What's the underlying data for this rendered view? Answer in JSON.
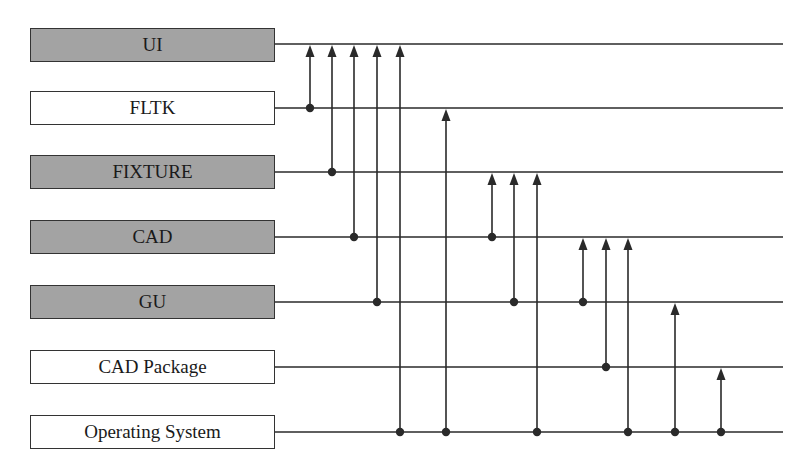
{
  "diagram": {
    "type": "layered dependency diagram",
    "layers": [
      {
        "id": "ui",
        "label": "UI",
        "style": "gray",
        "y": 44
      },
      {
        "id": "fltk",
        "label": "FLTK",
        "style": "white",
        "y": 108
      },
      {
        "id": "fixture",
        "label": "FIXTURE",
        "style": "gray",
        "y": 172
      },
      {
        "id": "cad",
        "label": "CAD",
        "style": "gray",
        "y": 237
      },
      {
        "id": "gu",
        "label": "GU",
        "style": "gray",
        "y": 302
      },
      {
        "id": "cad_package",
        "label": "CAD Package",
        "style": "white",
        "y": 367
      },
      {
        "id": "os",
        "label": "Operating System",
        "style": "white",
        "y": 432
      }
    ],
    "dependencies": [
      {
        "x": 310,
        "from": "fltk",
        "to": "ui"
      },
      {
        "x": 332,
        "from": "fixture",
        "to": "ui"
      },
      {
        "x": 354,
        "from": "cad",
        "to": "ui"
      },
      {
        "x": 377,
        "from": "gu",
        "to": "ui"
      },
      {
        "x": 400,
        "from": "os",
        "to": "ui"
      },
      {
        "x": 446,
        "from": "os",
        "to": "fltk"
      },
      {
        "x": 492,
        "from": "cad",
        "to": "fixture"
      },
      {
        "x": 514,
        "from": "gu",
        "to": "fixture"
      },
      {
        "x": 537,
        "from": "os",
        "to": "fixture"
      },
      {
        "x": 583,
        "from": "gu",
        "to": "cad"
      },
      {
        "x": 606,
        "from": "cad_package",
        "to": "cad"
      },
      {
        "x": 628,
        "from": "os",
        "to": "cad"
      },
      {
        "x": 675,
        "from": "os",
        "to": "gu"
      },
      {
        "x": 721,
        "from": "os",
        "to": "cad_package"
      }
    ],
    "colors": {
      "gray_fill": "#a3a3a3",
      "line": "#2a2a2a",
      "white_fill": "#ffffff"
    }
  }
}
